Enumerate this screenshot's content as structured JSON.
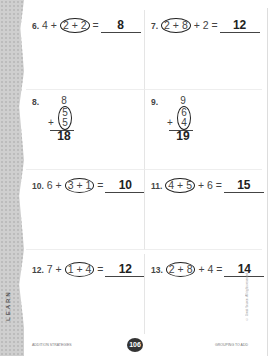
{
  "side_tab": "LEARN",
  "problems": [
    {
      "id": "6",
      "pre": "4 + ",
      "circled": "2 + 2",
      "post": " =",
      "answer": "8"
    },
    {
      "id": "7",
      "pre": "",
      "circled": "2 + 8",
      "post": " + 2 =",
      "answer": "12"
    },
    {
      "id": "8",
      "top": "8",
      "mid": "5",
      "bot": "5",
      "answer": "18"
    },
    {
      "id": "9",
      "top": "9",
      "mid": "6",
      "bot": "4",
      "answer": "19"
    },
    {
      "id": "10",
      "pre": "6 + ",
      "circled": "3 + 1",
      "post": " =",
      "answer": "10"
    },
    {
      "id": "11",
      "pre": "",
      "circled": "4 + 5",
      "post": " + 6 =",
      "answer": "15"
    },
    {
      "id": "12",
      "pre": "7 + ",
      "circled": "1 + 4",
      "post": " =",
      "answer": "12"
    },
    {
      "id": "13",
      "pre": "",
      "circled": "2 + 8",
      "post": " + 4 =",
      "answer": "14"
    }
  ],
  "footer": {
    "left": "ADDITION STRATEGIES",
    "page": "106",
    "right": "GROUPING TO ADD"
  },
  "copyright": "© Great Source. All rights reserved."
}
